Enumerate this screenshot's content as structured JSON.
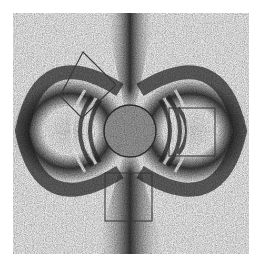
{
  "figure": {
    "frame": {
      "x": 13,
      "y": 13,
      "width": 236,
      "height": 241
    },
    "colors": {
      "background": "#ffffff",
      "light": "#f2f2f2",
      "dark": "#1e1e1e",
      "outline": "#2a2a2a"
    },
    "circle": {
      "cx": 130,
      "cy": 131,
      "r": 26
    },
    "regions": [
      {
        "id": "diamond-roi",
        "shape": "rotated-rect",
        "points": "83,52 116,85 82,118 60,96"
      },
      {
        "id": "right-roi",
        "shape": "rect",
        "x": 169,
        "y": 108,
        "width": 46,
        "height": 48
      },
      {
        "id": "bottom-roi",
        "shape": "rect",
        "x": 105,
        "y": 173,
        "width": 47,
        "height": 48
      }
    ]
  }
}
